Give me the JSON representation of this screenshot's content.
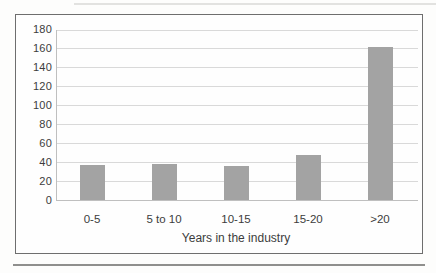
{
  "chart_data": {
    "type": "bar",
    "title": "",
    "categories": [
      "0-5",
      "5 to 10",
      "10-15",
      "15-20",
      ">20"
    ],
    "values": [
      37,
      38,
      36,
      48,
      162
    ],
    "xlabel": "Years in the industry",
    "ylabel": "",
    "ylim": [
      0,
      180
    ],
    "yticks": [
      0,
      20,
      40,
      60,
      80,
      100,
      120,
      140,
      160,
      180
    ],
    "grid": true,
    "legend": false,
    "colors": {
      "bar": "#a3a3a3",
      "gridline": "#d9d9d9",
      "axis_line": "#bfbfbf",
      "text": "#3c3c3c",
      "frame_border": "#6e6e6e"
    }
  }
}
